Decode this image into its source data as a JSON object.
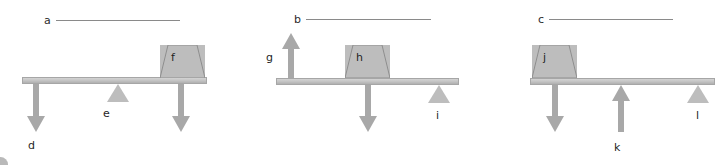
{
  "figure": {
    "colors": {
      "beam_fill": "#c6c6c6",
      "beam_stroke": "#a6a6a6",
      "block_fill": "#bdbdbd",
      "block_stroke": "#8e8e8e",
      "fulcrum_fill": "#bdbdbd",
      "arrow_fill": "#a8a8a8",
      "blank_line": "#8a8a8a",
      "text": "#1f1f1f"
    }
  },
  "blanks": [
    {
      "label": "a"
    },
    {
      "label": "b"
    },
    {
      "label": "c"
    }
  ],
  "panels": [
    {
      "id": "panel-1",
      "blank_label": "a",
      "block": {
        "label": "f"
      },
      "fulcrum": {
        "label": "e"
      },
      "arrows": [
        {
          "label": "d",
          "direction": "down"
        },
        {
          "label": "",
          "direction": "down"
        }
      ]
    },
    {
      "id": "panel-2",
      "blank_label": "b",
      "block": {
        "label": "h"
      },
      "fulcrum": {
        "label": "i"
      },
      "arrows": [
        {
          "label": "g",
          "direction": "up"
        },
        {
          "label": "",
          "direction": "down"
        }
      ]
    },
    {
      "id": "panel-3",
      "blank_label": "c",
      "block": {
        "label": "j"
      },
      "fulcrum": {
        "label": "l"
      },
      "arrows": [
        {
          "label": "",
          "direction": "down"
        },
        {
          "label": "k",
          "direction": "up"
        }
      ]
    }
  ]
}
